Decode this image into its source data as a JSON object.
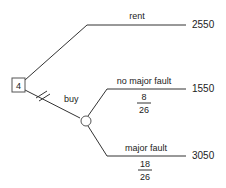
{
  "decision_node": {
    "label": "4"
  },
  "branches": {
    "rent": {
      "label": "rent",
      "payoff": "2550"
    },
    "buy": {
      "label": "buy"
    },
    "no_major_fault": {
      "label": "no major fault",
      "prob_num": "8",
      "prob_den": "26",
      "payoff": "1550"
    },
    "major_fault": {
      "label": "major fault",
      "prob_num": "18",
      "prob_den": "26",
      "payoff": "3050"
    }
  }
}
